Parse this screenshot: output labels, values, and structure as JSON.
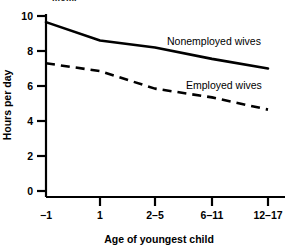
{
  "top_clipped_text": "mom.",
  "chart_data": {
    "type": "line",
    "title": "",
    "xlabel": "Age of youngest child",
    "ylabel": "Hours per day",
    "categories": [
      "-1",
      "1",
      "2-5",
      "6-11",
      "12-17"
    ],
    "x_tick_labels": [
      "−1",
      "1",
      "2–5",
      "6–11",
      "12–17"
    ],
    "y_tick_labels": [
      "0",
      "2",
      "4",
      "6",
      "8",
      "10"
    ],
    "y_ticks": [
      0,
      2,
      4,
      6,
      8,
      10
    ],
    "ylim": [
      0,
      10.6
    ],
    "grid": false,
    "legend": "inline-annotations",
    "series": [
      {
        "name": "Nonemployed wives",
        "style": "solid",
        "color": "#000000",
        "values": [
          9.65,
          8.6,
          8.2,
          7.55,
          7.0
        ],
        "label_text": "Nonemployed wives"
      },
      {
        "name": "Employed wives",
        "style": "dashed",
        "color": "#000000",
        "values": [
          7.3,
          6.85,
          5.85,
          5.35,
          4.65
        ],
        "label_text": "Employed wives"
      }
    ],
    "annotations": [
      {
        "text": "Nonemployed wives",
        "x": 167,
        "y": 42
      },
      {
        "text": "Employed wives",
        "x": 186,
        "y": 86
      }
    ]
  }
}
